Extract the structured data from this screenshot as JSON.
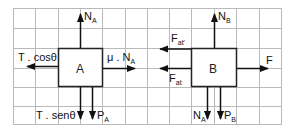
{
  "colors": {
    "grid": "#b9b9b9",
    "ink": "#111111",
    "background": "#ffffff"
  },
  "diagrams": [
    {
      "id": "A",
      "box_label": "A",
      "forces": [
        {
          "name": "normal-up",
          "label": "N",
          "sub": "A",
          "direction": "up"
        },
        {
          "name": "tension-horizontal",
          "label": "T . cosθ",
          "sub": "",
          "direction": "left"
        },
        {
          "name": "friction",
          "label": "μ . N",
          "sub": "A",
          "direction": "right"
        },
        {
          "name": "tension-vertical",
          "label": "T . senθ",
          "sub": "",
          "direction": "down"
        },
        {
          "name": "weight",
          "label": "P",
          "sub": "A",
          "direction": "down"
        }
      ]
    },
    {
      "id": "B",
      "box_label": "B",
      "forces": [
        {
          "name": "normal-up",
          "label": "N",
          "sub": "B",
          "direction": "up"
        },
        {
          "name": "friction-top",
          "label": "F",
          "sub": "at'",
          "direction": "left"
        },
        {
          "name": "friction-bottom",
          "label": "F",
          "sub": "at",
          "direction": "left"
        },
        {
          "name": "applied-force",
          "label": "F",
          "sub": "",
          "direction": "right"
        },
        {
          "name": "normal-from-a",
          "label": "N",
          "sub": "A",
          "direction": "down"
        },
        {
          "name": "weight",
          "label": "P",
          "sub": "B",
          "direction": "down"
        }
      ]
    }
  ]
}
